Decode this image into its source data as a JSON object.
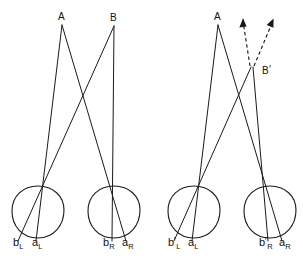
{
  "figure": {
    "background_color": "#ffffff",
    "line_color": "#1a1a1a",
    "width": 303,
    "height": 263,
    "panels": [
      {
        "id": "left-panel",
        "name": "normal-fixation-panel",
        "points": [
          {
            "id": "A",
            "label": "A",
            "primed": false,
            "x": 62,
            "y": 25
          },
          {
            "id": "B",
            "label": "B",
            "primed": false,
            "x": 114,
            "y": 26
          }
        ],
        "eyes": [
          {
            "id": "left-eye",
            "name": "left-eye",
            "cx": 38,
            "cy": 212,
            "r": 26,
            "image_labels": [
              {
                "id": "bL",
                "base": "b",
                "sub": "L",
                "primed": false,
                "x": 15,
                "y": 243
              },
              {
                "id": "aL",
                "base": "a",
                "sub": "L",
                "primed": false,
                "x": 33,
                "y": 243
              }
            ]
          },
          {
            "id": "right-eye",
            "name": "right-eye",
            "cx": 114,
            "cy": 212,
            "r": 26,
            "image_labels": [
              {
                "id": "bR",
                "base": "b",
                "sub": "R",
                "primed": false,
                "x": 105,
                "y": 243
              },
              {
                "id": "aR",
                "base": "a",
                "sub": "R",
                "primed": false,
                "x": 124,
                "y": 243
              }
            ]
          }
        ],
        "virtual_rays": []
      },
      {
        "id": "right-panel",
        "name": "displaced-fixation-panel",
        "points": [
          {
            "id": "A",
            "label": "A",
            "primed": false,
            "x": 218,
            "y": 25
          },
          {
            "id": "Bprime",
            "label": "B",
            "primed": true,
            "x": 258,
            "y": 72
          }
        ],
        "eyes": [
          {
            "id": "left-eye",
            "name": "left-eye",
            "cx": 194,
            "cy": 212,
            "r": 26,
            "image_labels": [
              {
                "id": "bLprime",
                "base": "b",
                "sub": "L",
                "primed": true,
                "x": 170,
                "y": 243
              },
              {
                "id": "aL",
                "base": "a",
                "sub": "L",
                "primed": false,
                "x": 189,
                "y": 243
              }
            ]
          },
          {
            "id": "right-eye",
            "name": "right-eye",
            "cx": 270,
            "cy": 212,
            "r": 26,
            "image_labels": [
              {
                "id": "bRprime",
                "base": "b",
                "sub": "R",
                "primed": true,
                "x": 261,
                "y": 243
              },
              {
                "id": "aR",
                "base": "a",
                "sub": "R",
                "primed": false,
                "x": 280,
                "y": 243
              }
            ]
          }
        ],
        "virtual_rays": [
          {
            "id": "virtual-ray-left",
            "from_x": 250,
            "from_y": 66,
            "to_x": 243,
            "to_y": 20,
            "style": "dashed",
            "arrow": true
          },
          {
            "id": "virtual-ray-right",
            "from_x": 254,
            "from_y": 66,
            "to_x": 273,
            "to_y": 20,
            "style": "dashed",
            "arrow": true
          }
        ]
      }
    ]
  }
}
